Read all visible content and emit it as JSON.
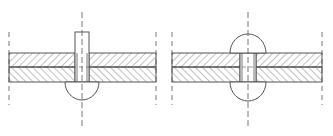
{
  "diagram": {
    "title": "",
    "colors": {
      "stroke": "#555555",
      "hatch": "#777777",
      "background": "#ffffff"
    },
    "panels": [
      {
        "id": "before-setting",
        "label": "",
        "plates": {
          "x1": 9,
          "x2": 156,
          "top_y": 53,
          "mid_y": 67,
          "bottom_y": 82
        },
        "rivet": {
          "cx": 82,
          "shank_left": 75,
          "shank_right": 89,
          "shank_top": 32,
          "head_bottom": 101,
          "head_radius": 17
        },
        "centerline": {
          "x": 82,
          "y1": 12,
          "y2": 127
        },
        "break_lines": [
          {
            "x": 9,
            "y1": 32,
            "y2": 105
          },
          {
            "x": 156,
            "y1": 32,
            "y2": 105
          }
        ]
      },
      {
        "id": "after-setting",
        "label": "",
        "plates": {
          "x1": 172,
          "x2": 322,
          "top_y": 53,
          "mid_y": 67,
          "bottom_y": 82
        },
        "rivet": {
          "cx": 248,
          "shank_left": 240,
          "shank_right": 256,
          "top_head_top": 34,
          "bottom_head_bottom": 101,
          "head_radius": 18
        },
        "centerline": {
          "x": 248,
          "y1": 12,
          "y2": 127
        },
        "break_lines": [
          {
            "x": 172,
            "y1": 32,
            "y2": 105
          },
          {
            "x": 322,
            "y1": 32,
            "y2": 105
          }
        ]
      }
    ]
  }
}
